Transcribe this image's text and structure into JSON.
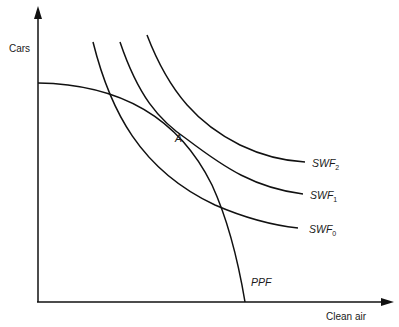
{
  "diagram": {
    "type": "economics-graph",
    "axes": {
      "y_label": "Cars",
      "x_label": "Clean air"
    },
    "curves": {
      "ppf": {
        "label": "PPF"
      },
      "swf0": {
        "label_main": "SWF",
        "label_sub": "0"
      },
      "swf1": {
        "label_main": "SWF",
        "label_sub": "1"
      },
      "swf2": {
        "label_main": "SWF",
        "label_sub": "2"
      }
    },
    "points": {
      "a": {
        "label": "A"
      }
    },
    "colors": {
      "line": "#111111",
      "text": "#1a1a1a",
      "background": "#ffffff"
    }
  }
}
